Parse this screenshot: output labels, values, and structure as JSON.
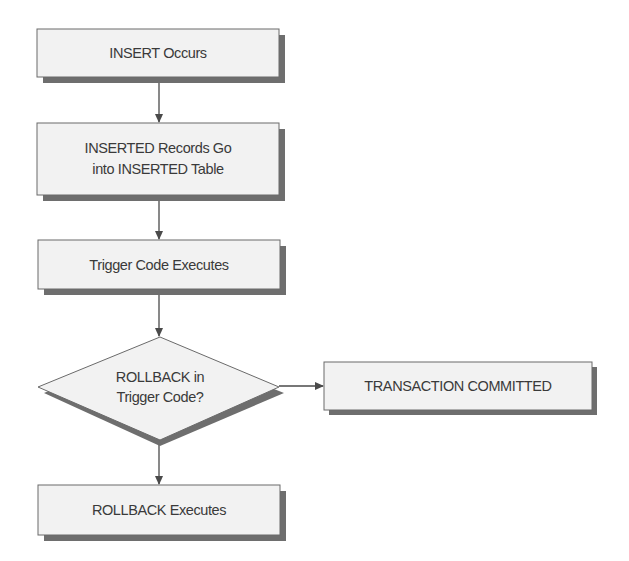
{
  "diagram": {
    "type": "flowchart",
    "colors": {
      "background": "#ffffff",
      "box_fill": "#f2f2f2",
      "box_border": "#6a6a6a",
      "shadow": "#6e6e6e",
      "text": "#3a3a3a",
      "arrow": "#4a4a4a"
    },
    "nodes": [
      {
        "id": "insert_occurs",
        "shape": "rectangle",
        "lines": [
          "INSERT Occurs"
        ]
      },
      {
        "id": "inserted_records",
        "shape": "rectangle",
        "lines": [
          "INSERTED Records Go",
          "into INSERTED Table"
        ]
      },
      {
        "id": "trigger_executes",
        "shape": "rectangle",
        "lines": [
          "Trigger Code Executes"
        ]
      },
      {
        "id": "rollback_decision",
        "shape": "diamond",
        "lines": [
          "ROLLBACK in",
          "Trigger Code?"
        ]
      },
      {
        "id": "transaction_committed",
        "shape": "rectangle",
        "lines": [
          "TRANSACTION COMMITTED"
        ]
      },
      {
        "id": "rollback_executes",
        "shape": "rectangle",
        "lines": [
          "ROLLBACK Executes"
        ]
      }
    ],
    "edges": [
      {
        "from": "insert_occurs",
        "to": "inserted_records"
      },
      {
        "from": "inserted_records",
        "to": "trigger_executes"
      },
      {
        "from": "trigger_executes",
        "to": "rollback_decision"
      },
      {
        "from": "rollback_decision",
        "to": "transaction_committed"
      },
      {
        "from": "rollback_decision",
        "to": "rollback_executes"
      }
    ]
  }
}
